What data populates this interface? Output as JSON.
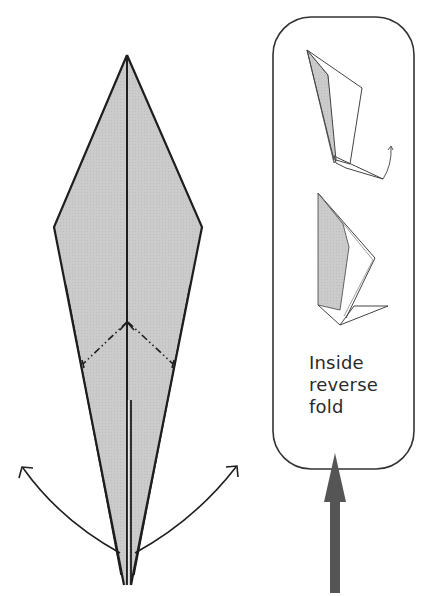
{
  "diagram": {
    "type": "origami-instruction",
    "main_figure": {
      "name": "kite-shaped folded model",
      "fill_color": "#c9c9c9",
      "line_color": "#1e1e1e",
      "fold_marks": [
        "mountain-fold-left",
        "mountain-fold-right"
      ],
      "arrows": [
        "swing-out-left",
        "swing-out-right"
      ]
    },
    "callout": {
      "label_lines": [
        "Inside",
        "reverse",
        "fold"
      ],
      "border_color": "#333333",
      "steps": [
        "inside-reverse-fold-in-progress",
        "inside-reverse-fold-result"
      ]
    },
    "pointer_arrow": {
      "color": "#555555",
      "direction": "up"
    }
  }
}
